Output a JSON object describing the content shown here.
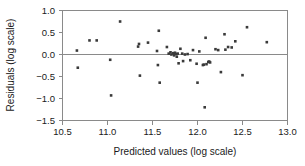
{
  "chart_data": {
    "type": "scatter",
    "title": "",
    "xlabel": "Predicted values (log scale)",
    "ylabel": "Residuals (log scale)",
    "xlim": [
      10.5,
      13.0
    ],
    "ylim": [
      -1.5,
      1.0
    ],
    "xticks": [
      10.5,
      11.0,
      11.5,
      12.0,
      12.5,
      13.0
    ],
    "yticks": [
      1.0,
      0.5,
      0.0,
      -0.5,
      -1.0,
      -1.5
    ],
    "xtick_labels": [
      "10.5",
      "11.0",
      "11.5",
      "12.0",
      "12.5",
      "13.0"
    ],
    "ytick_labels": [
      "1.0",
      "0.5",
      "0.0",
      "−0.5",
      "−1.0",
      "−1.5"
    ],
    "grid": false,
    "legend": null,
    "reference_line": {
      "orientation": "horizontal",
      "y": 0.0,
      "color": "#8a8a8a"
    },
    "marker": {
      "shape": "square",
      "color": "#3a3a3a",
      "size": 2.6
    },
    "n_points": 55,
    "points": [
      {
        "x": 10.66,
        "y": 0.09
      },
      {
        "x": 10.67,
        "y": -0.3
      },
      {
        "x": 10.8,
        "y": 0.32
      },
      {
        "x": 10.88,
        "y": 0.32
      },
      {
        "x": 11.03,
        "y": -0.12
      },
      {
        "x": 11.04,
        "y": -0.93
      },
      {
        "x": 11.14,
        "y": 0.75
      },
      {
        "x": 11.34,
        "y": 0.18
      },
      {
        "x": 11.35,
        "y": 0.24
      },
      {
        "x": 11.36,
        "y": -0.48
      },
      {
        "x": 11.45,
        "y": 0.27
      },
      {
        "x": 11.55,
        "y": 0.08
      },
      {
        "x": 11.56,
        "y": -0.24
      },
      {
        "x": 11.57,
        "y": 0.54
      },
      {
        "x": 11.58,
        "y": -0.64
      },
      {
        "x": 11.66,
        "y": 0.17
      },
      {
        "x": 11.68,
        "y": 0.02
      },
      {
        "x": 11.7,
        "y": 0.05
      },
      {
        "x": 11.71,
        "y": 0.0
      },
      {
        "x": 11.73,
        "y": 0.03
      },
      {
        "x": 11.74,
        "y": -0.02
      },
      {
        "x": 11.75,
        "y": 0.04
      },
      {
        "x": 11.76,
        "y": 0.01
      },
      {
        "x": 11.77,
        "y": -0.05
      },
      {
        "x": 11.78,
        "y": 0.02
      },
      {
        "x": 11.79,
        "y": -0.2
      },
      {
        "x": 11.81,
        "y": 0.13
      },
      {
        "x": 11.83,
        "y": 0.02
      },
      {
        "x": 11.84,
        "y": -0.15
      },
      {
        "x": 11.86,
        "y": 0.0
      },
      {
        "x": 11.92,
        "y": -0.13
      },
      {
        "x": 11.95,
        "y": 0.1
      },
      {
        "x": 11.99,
        "y": -0.21
      },
      {
        "x": 12.0,
        "y": -0.64
      },
      {
        "x": 12.02,
        "y": 0.07
      },
      {
        "x": 12.06,
        "y": -0.24
      },
      {
        "x": 12.07,
        "y": -0.23
      },
      {
        "x": 12.08,
        "y": -1.2
      },
      {
        "x": 12.09,
        "y": 0.38
      },
      {
        "x": 12.1,
        "y": -0.22
      },
      {
        "x": 12.12,
        "y": -0.17
      },
      {
        "x": 12.13,
        "y": -0.16
      },
      {
        "x": 12.14,
        "y": -0.18
      },
      {
        "x": 12.2,
        "y": 0.12
      },
      {
        "x": 12.23,
        "y": 0.1
      },
      {
        "x": 12.26,
        "y": -0.4
      },
      {
        "x": 12.3,
        "y": 0.46
      },
      {
        "x": 12.31,
        "y": 0.11
      },
      {
        "x": 12.34,
        "y": 0.17
      },
      {
        "x": 12.38,
        "y": 0.16
      },
      {
        "x": 12.42,
        "y": 0.3
      },
      {
        "x": 12.5,
        "y": -0.47
      },
      {
        "x": 12.55,
        "y": 0.62
      },
      {
        "x": 12.77,
        "y": 0.28
      },
      {
        "x": 11.89,
        "y": 0.01
      }
    ]
  },
  "figure": {
    "background_color": "#ffffff",
    "axis_color": "#8a8a8a",
    "text_color": "#1a1a1a"
  }
}
